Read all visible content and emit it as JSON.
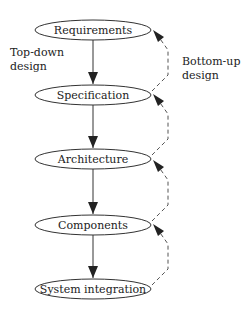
{
  "diagram": {
    "nodes": [
      {
        "id": "requirements",
        "label": "Requirements",
        "cy": 30
      },
      {
        "id": "specification",
        "label": "Specification",
        "cy": 95
      },
      {
        "id": "architecture",
        "label": "Architecture",
        "cy": 159
      },
      {
        "id": "components",
        "label": "Components",
        "cy": 225
      },
      {
        "id": "system-integration",
        "label": "System integration",
        "cy": 289
      }
    ],
    "left_annotation": {
      "line1": "Top-down",
      "line2": "design"
    },
    "right_annotation": {
      "line1": "Bottom-up",
      "line2": "design"
    },
    "edges_down": "solid arrows top to bottom",
    "edges_up": "dashed arrows bottom to top",
    "colors": {
      "stroke": "#333333",
      "dashed": "#555555",
      "text": "#222222",
      "background": "#ffffff"
    }
  }
}
